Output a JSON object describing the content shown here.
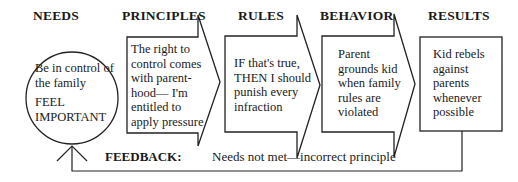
{
  "headers": {
    "needs": "NEEDS",
    "principles": "PRINCIPLES",
    "rules": "RULES",
    "behavior": "BEHAVIOR",
    "results": "RESULTS"
  },
  "nodes": {
    "needs": {
      "shape": "circle",
      "line1": "Be in control of\nthe family",
      "line2": "FEEL\nIMPORTANT"
    },
    "principles": {
      "shape": "arrow",
      "text": "The right to\ncontrol comes\nwith parent-\nhood— I'm\nentitled to\napply pressure"
    },
    "rules": {
      "shape": "arrow",
      "text": "IF that's true,\nTHEN I should\npunish every\ninfraction"
    },
    "behavior": {
      "shape": "arrow",
      "text": "Parent\ngrounds kid\nwhen family\nrules are\nviolated"
    },
    "results": {
      "shape": "box",
      "text": "Kid rebels\nagainst\nparents\nwhenever\npossible"
    }
  },
  "feedback": {
    "label": "FEEDBACK:",
    "text": "Needs not met—incorrect principle"
  },
  "colors": {
    "stroke": "#222222",
    "text": "#1a1a1a",
    "background": "#ffffff"
  }
}
